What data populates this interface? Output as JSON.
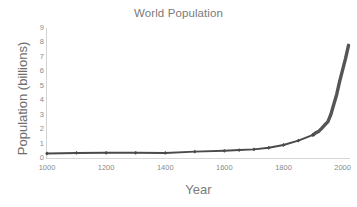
{
  "chart_data": {
    "type": "line",
    "title": "World Population",
    "xlabel": "Year",
    "ylabel": "Population (billions)",
    "xlim": [
      1000,
      2025
    ],
    "ylim": [
      0,
      9
    ],
    "xticks": [
      "1000",
      "1200",
      "1400",
      "1600",
      "1800",
      "2000"
    ],
    "xtick_values": [
      1000,
      1200,
      1400,
      1600,
      1800,
      2000
    ],
    "yticks": [
      "9",
      "8",
      "7",
      "6",
      "5",
      "4",
      "3",
      "2",
      "1",
      "0"
    ],
    "ytick_values": [
      9,
      8,
      7,
      6,
      5,
      4,
      3,
      2,
      1,
      0
    ],
    "grid": false,
    "legend": false,
    "line_color": "#4a4a4a",
    "marker": "diamond",
    "series": [
      {
        "name": "World Population",
        "x": [
          1000,
          1100,
          1200,
          1300,
          1400,
          1500,
          1600,
          1650,
          1700,
          1750,
          1800,
          1850,
          1900,
          1910,
          1920,
          1930,
          1940,
          1950,
          1960,
          1970,
          1980,
          1990,
          2000,
          2010,
          2020
        ],
        "values": [
          0.31,
          0.35,
          0.36,
          0.36,
          0.35,
          0.44,
          0.5,
          0.55,
          0.6,
          0.71,
          0.9,
          1.2,
          1.6,
          1.75,
          1.86,
          2.07,
          2.3,
          2.5,
          3.0,
          3.7,
          4.4,
          5.3,
          6.1,
          6.9,
          7.8
        ]
      }
    ]
  },
  "figure": {
    "background_color": "#ffffff",
    "title_color": "#7a7a7a",
    "axis_color": "#d2d2d2",
    "tick_label_color": "#8a8a8a"
  }
}
